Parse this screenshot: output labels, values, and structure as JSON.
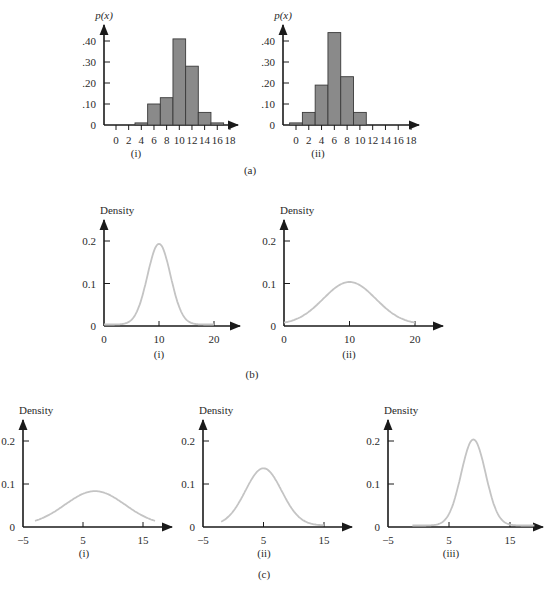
{
  "figure": {
    "panel_labels": {
      "a": "(a)",
      "b": "(b)",
      "c": "(c)"
    }
  },
  "chart_data": [
    {
      "id": "a-i",
      "panel": "(a)",
      "sublabel": "(i)",
      "type": "bar",
      "ylabel": "p(x)",
      "xlabel": "",
      "categories": [
        0,
        2,
        4,
        6,
        8,
        10,
        12,
        14,
        16,
        18
      ],
      "values": [
        0,
        0,
        0.01,
        0.1,
        0.13,
        0.41,
        0.28,
        0.06,
        0.01,
        0
      ],
      "yticks": [
        ".40",
        ".30",
        ".20",
        ".10",
        "0"
      ],
      "ytick_values": [
        0.4,
        0.3,
        0.2,
        0.1,
        0
      ],
      "xticks": [
        "0",
        "2",
        "4",
        "6",
        "8",
        "10",
        "12",
        "14",
        "16",
        "18"
      ],
      "ylim": [
        0,
        0.45
      ]
    },
    {
      "id": "a-ii",
      "panel": "(a)",
      "sublabel": "(ii)",
      "type": "bar",
      "ylabel": "p(x)",
      "xlabel": "",
      "categories": [
        0,
        2,
        4,
        6,
        8,
        10,
        12,
        14,
        16,
        18
      ],
      "values": [
        0.01,
        0.06,
        0.19,
        0.44,
        0.23,
        0.06,
        0,
        0,
        0,
        0
      ],
      "yticks": [
        ".40",
        ".30",
        ".20",
        ".10",
        "0"
      ],
      "ytick_values": [
        0.4,
        0.3,
        0.2,
        0.1,
        0
      ],
      "xticks": [
        "0",
        "2",
        "4",
        "6",
        "8",
        "10",
        "12",
        "14",
        "16",
        "18"
      ],
      "ylim": [
        0,
        0.45
      ]
    },
    {
      "id": "b-i",
      "panel": "(b)",
      "sublabel": "(i)",
      "type": "line",
      "ylabel": "Density",
      "distribution": "normal",
      "mean": 10,
      "sd": 2.1,
      "peak": 0.19,
      "x_range": [
        0,
        20
      ],
      "xticks": [
        "0",
        "10",
        "20"
      ],
      "yticks": [
        "0.2",
        "0.1",
        "0"
      ],
      "ylim": [
        0,
        0.25
      ]
    },
    {
      "id": "b-ii",
      "panel": "(b)",
      "sublabel": "(ii)",
      "type": "line",
      "ylabel": "Density",
      "distribution": "normal",
      "mean": 10,
      "sd": 4,
      "peak": 0.1,
      "x_range": [
        0,
        20
      ],
      "xticks": [
        "0",
        "10",
        "20"
      ],
      "yticks": [
        "0.2",
        "0.1",
        "0"
      ],
      "ylim": [
        0,
        0.25
      ]
    },
    {
      "id": "c-i",
      "panel": "(c)",
      "sublabel": "(i)",
      "type": "line",
      "ylabel": "Density",
      "distribution": "normal",
      "mean": 7,
      "sd": 5,
      "peak": 0.08,
      "x_range": [
        -3,
        17
      ],
      "xticks": [
        "−5",
        "5",
        "15"
      ],
      "yticks": [
        "0.2",
        "0.1",
        "0"
      ],
      "ylim": [
        0,
        0.25
      ]
    },
    {
      "id": "c-ii",
      "panel": "(c)",
      "sublabel": "(ii)",
      "type": "line",
      "ylabel": "Density",
      "distribution": "normal",
      "mean": 5,
      "sd": 3,
      "peak": 0.133,
      "x_range": [
        -2,
        15
      ],
      "xticks": [
        "−5",
        "5",
        "15"
      ],
      "yticks": [
        "0.2",
        "0.1",
        "0"
      ],
      "ylim": [
        0,
        0.25
      ]
    },
    {
      "id": "c-iii",
      "panel": "(c)",
      "sublabel": "(iii)",
      "type": "line",
      "ylabel": "Density",
      "distribution": "normal",
      "mean": 9,
      "sd": 2,
      "peak": 0.2,
      "x_range": [
        -1,
        19
      ],
      "xticks": [
        "−5",
        "5",
        "15"
      ],
      "yticks": [
        "0.2",
        "0.1",
        "0"
      ],
      "ylim": [
        0,
        0.25
      ]
    }
  ]
}
